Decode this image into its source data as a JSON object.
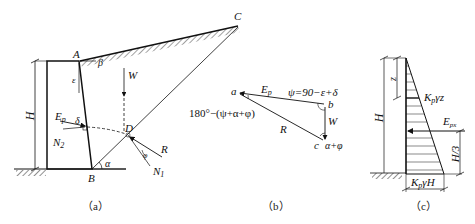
{
  "figure": {
    "panel_a": {
      "caption": "（a）",
      "labels": {
        "A": "A",
        "B": "B",
        "C": "C",
        "D": "D",
        "H": "H",
        "W": "W",
        "R": "R",
        "Ep": "E",
        "Ep_sub": "p",
        "N2": "N",
        "N2_sub": "2",
        "N1": "N",
        "N1_sub": "1",
        "beta": "β",
        "epsilon": "ε",
        "delta": "δ",
        "alpha": "α",
        "phi": "φ"
      }
    },
    "panel_b": {
      "caption": "（b）",
      "labels": {
        "a": "a",
        "b": "b",
        "c": "c",
        "Ep": "E",
        "Ep_sub": "p",
        "W": "W",
        "R": "R",
        "psi_eq": "ψ=90−ε+δ",
        "angle_a": "180°−(ψ+α+φ)",
        "angle_c": "α+φ"
      }
    },
    "panel_c": {
      "caption": "（c）",
      "labels": {
        "H": "H",
        "z": "z",
        "Kpgz": "K",
        "Kpgz_sub": "p",
        "Kpgz_tail": "γz",
        "Epx": "E",
        "Epx_sub": "px",
        "H3": "H/3",
        "KpgH": "K",
        "KpgH_sub": "p",
        "KpgH_tail": "γH"
      }
    }
  }
}
